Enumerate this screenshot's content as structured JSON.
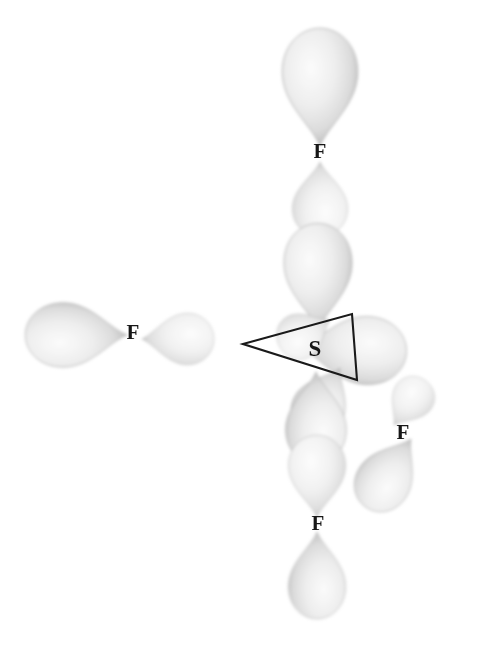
{
  "figure": {
    "central_atom_label": "S",
    "ligand_label": "F",
    "background_color": "#ffffff",
    "lobe_fill_light": "#f2f2f2",
    "lobe_fill_mid": "#d8d8d8",
    "lobe_edge": "#9a9a9a",
    "line_color": "#1a1a1a"
  },
  "center": {
    "label": "S",
    "x": 315,
    "y": 351
  },
  "frame": {
    "name": "trigonal-wedge",
    "points": "243,344 352,314 357,380",
    "stroke": "#1a1a1a"
  },
  "ligands": [
    {
      "id": "f-top",
      "label": "F",
      "x": 320,
      "y": 153
    },
    {
      "id": "f-left",
      "label": "F",
      "x": 133,
      "y": 334
    },
    {
      "id": "f-bottom-right",
      "label": "F",
      "x": 403,
      "y": 434
    },
    {
      "id": "f-bottom",
      "label": "F",
      "x": 318,
      "y": 525
    }
  ],
  "orbital_lobes": [
    {
      "id": "f-top-major",
      "owner": "F",
      "kind": "p-lobe-large",
      "direction": "up"
    },
    {
      "id": "f-top-minor",
      "owner": "F",
      "kind": "p-lobe-small",
      "direction": "down"
    },
    {
      "id": "s-up",
      "owner": "S",
      "kind": "p-lobe",
      "direction": "up"
    },
    {
      "id": "f-left-major",
      "owner": "F",
      "kind": "p-lobe-large",
      "direction": "left"
    },
    {
      "id": "f-left-minor",
      "owner": "F",
      "kind": "p-lobe-small",
      "direction": "right"
    },
    {
      "id": "s-left",
      "owner": "S",
      "kind": "p-lobe",
      "direction": "left"
    },
    {
      "id": "s-right-upper",
      "owner": "S",
      "kind": "p-lobe",
      "direction": "right-up"
    },
    {
      "id": "s-down-right",
      "owner": "S",
      "kind": "p-lobe",
      "direction": "down-right"
    },
    {
      "id": "f-br-minor",
      "owner": "F",
      "kind": "p-lobe-small",
      "direction": "up-left"
    },
    {
      "id": "f-br-major",
      "owner": "F",
      "kind": "p-lobe-large",
      "direction": "down-right"
    },
    {
      "id": "s-down",
      "owner": "S",
      "kind": "p-lobe",
      "direction": "down"
    },
    {
      "id": "f-bottom-minor",
      "owner": "F",
      "kind": "p-lobe-small",
      "direction": "up"
    },
    {
      "id": "f-bottom-major",
      "owner": "F",
      "kind": "p-lobe-large",
      "direction": "down"
    }
  ]
}
